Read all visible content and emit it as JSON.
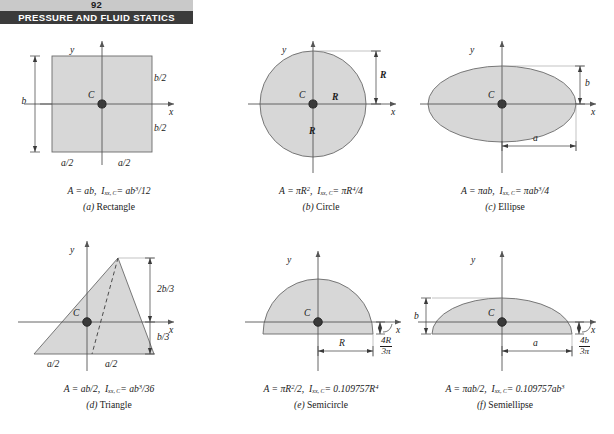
{
  "header": {
    "folio": "92",
    "running_head": "PRESSURE AND FLUID STATICS"
  },
  "figure": {
    "axis_labels": {
      "x": "x",
      "y": "y"
    },
    "centroid_label": "C",
    "panels": [
      {
        "key": "rectangle",
        "tag": "(a)",
        "name": "Rectangle",
        "formula_area": "A = ab,",
        "formula_inertia_lhs": "I",
        "formula_inertia_sub": "xx, C",
        "formula_inertia_rhs": "= ab",
        "formula_inertia_exp": "3",
        "formula_inertia_tail": "/12",
        "dimensions": [
          {
            "id": "height-b",
            "label": "b"
          },
          {
            "id": "half-height-top",
            "label": "b/2"
          },
          {
            "id": "half-height-bottom",
            "label": "b/2"
          },
          {
            "id": "half-width-left",
            "label": "a/2"
          },
          {
            "id": "half-width-right",
            "label": "a/2"
          }
        ]
      },
      {
        "key": "circle",
        "tag": "(b)",
        "name": "Circle",
        "formula_area_lhs": "A = πR",
        "formula_area_exp": "2",
        "formula_area_tail": ",",
        "formula_inertia_lhs": "I",
        "formula_inertia_sub": "xx, C",
        "formula_inertia_rhs": "= πR",
        "formula_inertia_exp": "4",
        "formula_inertia_tail": "/4",
        "dimensions": [
          {
            "id": "radius-right",
            "label": "R"
          },
          {
            "id": "radius-down",
            "label": "R"
          },
          {
            "id": "radius-vertical",
            "label": "R"
          }
        ]
      },
      {
        "key": "ellipse",
        "tag": "(c)",
        "name": "Ellipse",
        "formula_area": "A = πab,",
        "formula_inertia_lhs": "I",
        "formula_inertia_sub": "xx, C",
        "formula_inertia_rhs": "= πab",
        "formula_inertia_exp": "3",
        "formula_inertia_tail": "/4",
        "dimensions": [
          {
            "id": "semi-minor-b",
            "label": "b"
          },
          {
            "id": "semi-major-a",
            "label": "a"
          }
        ]
      },
      {
        "key": "triangle",
        "tag": "(d)",
        "name": "Triangle",
        "formula_area": "A = ab/2,",
        "formula_inertia_lhs": "I",
        "formula_inertia_sub": "xx, C",
        "formula_inertia_rhs": "= ab",
        "formula_inertia_exp": "3",
        "formula_inertia_tail": "/36",
        "dimensions": [
          {
            "id": "upper-2b3",
            "label": "2b/3"
          },
          {
            "id": "lower-b3",
            "label": "b/3"
          },
          {
            "id": "half-base-left",
            "label": "a/2"
          },
          {
            "id": "half-base-right",
            "label": "a/2"
          }
        ]
      },
      {
        "key": "semicircle",
        "tag": "(e)",
        "name": "Semicircle",
        "formula_area_lhs": "A = πR",
        "formula_area_exp": "2",
        "formula_area_tail": "/2,",
        "formula_inertia_lhs": "I",
        "formula_inertia_sub": "xx, C",
        "formula_inertia_rhs": "= 0.109757R",
        "formula_inertia_exp": "4",
        "formula_inertia_tail": "",
        "dimensions": [
          {
            "id": "radius-R",
            "label": "R"
          },
          {
            "id": "centroid-offset",
            "num": "4R",
            "den": "3π"
          }
        ]
      },
      {
        "key": "semiellipse",
        "tag": "(f)",
        "name": "Semiellipse",
        "formula_area": "A = πab/2,",
        "formula_inertia_lhs": "I",
        "formula_inertia_sub": "xx, C",
        "formula_inertia_rhs": "= 0.109757ab",
        "formula_inertia_exp": "3",
        "formula_inertia_tail": "",
        "dimensions": [
          {
            "id": "semi-minor-b",
            "label": "b"
          },
          {
            "id": "semi-major-a",
            "label": "a"
          },
          {
            "id": "centroid-offset",
            "num": "4b",
            "den": "3π"
          }
        ]
      }
    ]
  },
  "style": {
    "shape_fill": "#d7d7d7",
    "shape_stroke": "#6a6a6a",
    "axis_color": "#555555",
    "ink": "#1a1a1a",
    "header_band": "#3b3b3b",
    "folio_band": "#c9c9c9"
  }
}
